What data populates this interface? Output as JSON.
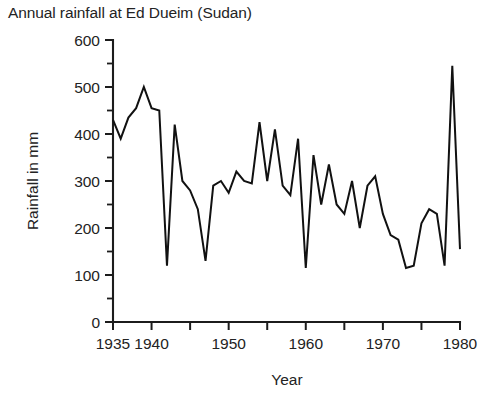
{
  "chart_data": {
    "type": "line",
    "title": "Annual rainfall at Ed Dueim (Sudan)",
    "xlabel": "Year",
    "ylabel": "Rainfall in mm",
    "xlim": [
      1935,
      1980
    ],
    "ylim": [
      0,
      600
    ],
    "grid": false,
    "legend": null,
    "x_ticks_major": [
      1935,
      1940,
      1945,
      1950,
      1955,
      1960,
      1965,
      1970,
      1975,
      1980
    ],
    "x_tick_labels": [
      "1935",
      "1940",
      "",
      "1950",
      "",
      "1960",
      "",
      "1970",
      "",
      "1980"
    ],
    "y_ticks_major": [
      0,
      100,
      200,
      300,
      400,
      500,
      600
    ],
    "y_tick_labels": [
      "0",
      "100",
      "200",
      "300",
      "400",
      "500",
      "600"
    ],
    "y_ticks_minor": [
      50,
      150,
      250,
      350,
      450,
      550
    ],
    "x": [
      1935,
      1936,
      1937,
      1938,
      1939,
      1940,
      1941,
      1942,
      1943,
      1944,
      1945,
      1946,
      1947,
      1948,
      1949,
      1950,
      1951,
      1952,
      1953,
      1954,
      1955,
      1956,
      1957,
      1958,
      1959,
      1960,
      1961,
      1962,
      1963,
      1964,
      1965,
      1966,
      1967,
      1968,
      1969,
      1970,
      1971,
      1972,
      1973,
      1974,
      1975,
      1976,
      1977,
      1978,
      1979,
      1980
    ],
    "values": [
      430,
      390,
      435,
      455,
      500,
      455,
      450,
      120,
      420,
      300,
      280,
      240,
      130,
      290,
      300,
      275,
      320,
      300,
      295,
      425,
      300,
      410,
      290,
      270,
      390,
      115,
      355,
      250,
      335,
      250,
      230,
      300,
      200,
      290,
      310,
      230,
      185,
      175,
      115,
      120,
      210,
      240,
      230,
      120,
      545,
      155
    ],
    "series": [
      {
        "name": "Annual rainfall",
        "color": "#111111",
        "values": [
          430,
          390,
          435,
          455,
          500,
          455,
          450,
          120,
          420,
          300,
          280,
          240,
          130,
          290,
          300,
          275,
          320,
          300,
          295,
          425,
          300,
          410,
          290,
          270,
          390,
          115,
          355,
          250,
          335,
          250,
          230,
          300,
          200,
          290,
          310,
          230,
          185,
          175,
          115,
          120,
          210,
          240,
          230,
          120,
          545,
          155
        ]
      }
    ],
    "annotations": [],
    "notes": {
      "min_value": 115,
      "max_value": 545,
      "units": "mm"
    }
  }
}
